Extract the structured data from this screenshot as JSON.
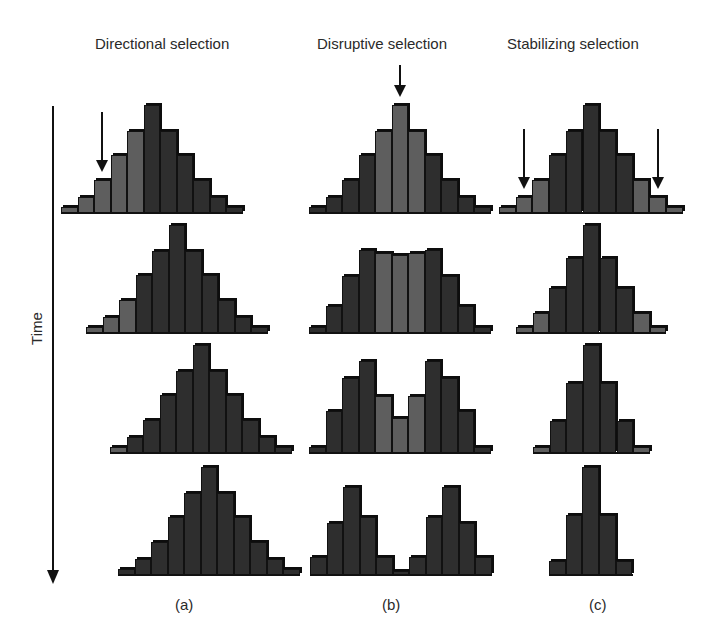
{
  "titles": {
    "directional": "Directional selection",
    "disruptive": "Disruptive selection",
    "stabilizing": "Stabilizing selection"
  },
  "axis": {
    "time_label": "Time"
  },
  "panel_labels": {
    "a": "(a)",
    "b": "(b)",
    "c": "(c)"
  },
  "colors": {
    "dark_bar": "#2e2e2e",
    "light_bar": "#5e5e5e",
    "outline": "#111111"
  },
  "chart_data": [
    {
      "type": "bar",
      "title": "Directional selection",
      "panel": "(a)",
      "xlabel": "Phenotype",
      "ylabel": "Frequency",
      "arrows": [
        {
          "row": 1,
          "bar_index": 2,
          "meaning": "selection against left tail"
        }
      ],
      "rows": [
        {
          "time": 1,
          "values": [
            6,
            16,
            33,
            58,
            82,
            108,
            82,
            58,
            33,
            16,
            6
          ],
          "light_bars": [
            0,
            1,
            2,
            3,
            4
          ]
        },
        {
          "time": 2,
          "values": [
            6,
            16,
            33,
            58,
            82,
            108,
            82,
            58,
            33,
            16,
            6
          ],
          "light_bars": [
            0,
            1,
            2
          ]
        },
        {
          "time": 3,
          "values": [
            6,
            16,
            33,
            58,
            82,
            108,
            82,
            58,
            33,
            16,
            6
          ],
          "light_bars": [
            0
          ]
        },
        {
          "time": 4,
          "values": [
            6,
            16,
            33,
            58,
            82,
            108,
            82,
            58,
            33,
            16,
            6
          ],
          "light_bars": []
        }
      ]
    },
    {
      "type": "bar",
      "title": "Disruptive selection",
      "panel": "(b)",
      "arrows": [
        {
          "row": 1,
          "bar_index": 5,
          "meaning": "selection against middle"
        }
      ],
      "rows": [
        {
          "time": 1,
          "values": [
            6,
            16,
            33,
            58,
            82,
            108,
            82,
            58,
            33,
            16,
            6
          ],
          "light_bars": [
            4,
            5,
            6
          ]
        },
        {
          "time": 2,
          "values": [
            6,
            27,
            57,
            83,
            80,
            78,
            80,
            83,
            57,
            27,
            6
          ],
          "light_bars": [
            4,
            5,
            6
          ]
        },
        {
          "time": 3,
          "values": [
            6,
            42,
            75,
            92,
            57,
            35,
            57,
            92,
            75,
            42,
            6
          ],
          "light_bars": [
            4,
            5,
            6
          ]
        },
        {
          "time": 4,
          "values": [
            18,
            52,
            88,
            58,
            18,
            4,
            18,
            58,
            88,
            52,
            18
          ],
          "light_bars": []
        }
      ]
    },
    {
      "type": "bar",
      "title": "Stabilizing selection",
      "panel": "(c)",
      "arrows": [
        {
          "row": 1,
          "bar_index": 1,
          "meaning": "selection against left tail"
        },
        {
          "row": 1,
          "bar_index": 9,
          "meaning": "selection against right tail"
        }
      ],
      "rows": [
        {
          "time": 1,
          "values": [
            6,
            16,
            33,
            58,
            82,
            108,
            82,
            58,
            33,
            16,
            6
          ],
          "light_bars": [
            0,
            1,
            2,
            8,
            9,
            10
          ]
        },
        {
          "time": 2,
          "values": [
            6,
            20,
            45,
            75,
            108,
            75,
            45,
            20,
            6
          ],
          "light_bars": [
            0,
            1,
            7,
            8
          ]
        },
        {
          "time": 3,
          "values": [
            6,
            32,
            70,
            108,
            70,
            32,
            6
          ],
          "light_bars": [
            0,
            6
          ]
        },
        {
          "time": 4,
          "values": [
            14,
            60,
            108,
            60,
            14
          ],
          "light_bars": []
        }
      ]
    }
  ]
}
